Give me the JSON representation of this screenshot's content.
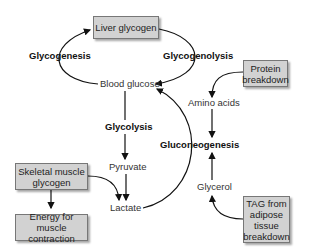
{
  "diagram": {
    "boxes": {
      "liver_glycogen": "Liver glycogen",
      "protein_breakdown": "Protein breakdown",
      "skeletal_muscle_glycogen": "Skeletal muscle glycogen",
      "energy_muscle": "Energy for muscle contraction",
      "tag_adipose": "TAG from adipose tissue breakdown"
    },
    "processes": {
      "glycogenesis": "Glycogenesis",
      "glycogenolysis": "Glycogenolysis",
      "glycolysis": "Glycolysis",
      "gluconeogenesis": "Gluconeogenesis"
    },
    "metabolites": {
      "blood_glucose": "Blood glucose",
      "amino_acids": "Amino acids",
      "pyruvate": "Pyruvate",
      "lactate": "Lactate",
      "glycerol": "Glycerol"
    },
    "colors": {
      "box_fill": "#d2d2d2",
      "box_border": "#777777",
      "arrow": "#111111"
    }
  }
}
